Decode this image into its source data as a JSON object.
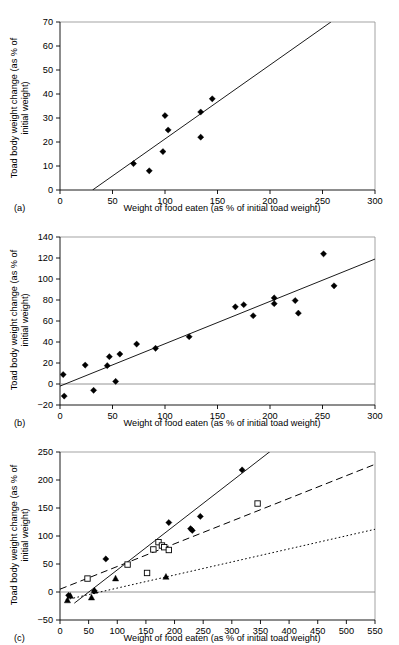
{
  "figure": {
    "axis_x_label": "Weight of food eaten (as % of initial toad weight)",
    "axis_y_label_line1": "Toad body weight change (as % of",
    "axis_y_label_line2": "initial weight)",
    "panel_labels": {
      "a": "(a)",
      "b": "(b)",
      "c": "(c)"
    }
  },
  "chart_data": [
    {
      "type": "scatter",
      "panel": "(a)",
      "title": "",
      "xlabel": "Weight of food eaten (as % of initial toad weight)",
      "ylabel": "Toad body weight change (as % of initial weight)",
      "xlim": [
        0,
        300
      ],
      "ylim": [
        0,
        70
      ],
      "xticks": [
        0,
        50,
        100,
        150,
        200,
        250,
        300
      ],
      "yticks": [
        0,
        10,
        20,
        30,
        40,
        50,
        60,
        70
      ],
      "grid": false,
      "legend": "none",
      "series": [
        {
          "name": "Toads",
          "marker": "filled-diamond",
          "points": [
            [
              70,
              11
            ],
            [
              85,
              8
            ],
            [
              98,
              16
            ],
            [
              100,
              31
            ],
            [
              103,
              25
            ],
            [
              134,
              22
            ],
            [
              134,
              32.5
            ],
            [
              145,
              38
            ]
          ]
        }
      ],
      "trendlines": [
        {
          "style": "solid",
          "x1": 31,
          "y1": 0,
          "x2": 258,
          "y2": 70
        }
      ]
    },
    {
      "type": "scatter",
      "panel": "(b)",
      "title": "",
      "xlabel": "Weight of food eaten (as % of initial toad weight)",
      "ylabel": "Toad body weight change (as % of initial weight)",
      "xlim": [
        0,
        300
      ],
      "ylim": [
        -20,
        140
      ],
      "xticks": [
        0,
        50,
        100,
        150,
        200,
        250,
        300
      ],
      "yticks": [
        -20,
        0,
        20,
        40,
        60,
        80,
        100,
        120,
        140
      ],
      "grid": false,
      "legend": "none",
      "zero_line": 0,
      "series": [
        {
          "name": "Toads",
          "marker": "filled-diamond",
          "points": [
            [
              3,
              9
            ],
            [
              4,
              -11.5
            ],
            [
              24,
              18
            ],
            [
              32,
              -6
            ],
            [
              45,
              17.5
            ],
            [
              47,
              26
            ],
            [
              53,
              2.5
            ],
            [
              57,
              28.5
            ],
            [
              73,
              38
            ],
            [
              91,
              34
            ],
            [
              123,
              45
            ],
            [
              167,
              73.5
            ],
            [
              175,
              75.5
            ],
            [
              184,
              65
            ],
            [
              204,
              82
            ],
            [
              204,
              76.5
            ],
            [
              224,
              79.5
            ],
            [
              227,
              67.5
            ],
            [
              251,
              124
            ],
            [
              261,
              93.5
            ]
          ]
        }
      ],
      "trendlines": [
        {
          "style": "solid",
          "x1": 0,
          "y1": -2,
          "x2": 300,
          "y2": 119
        }
      ]
    },
    {
      "type": "scatter",
      "panel": "(c)",
      "title": "",
      "xlabel": "Weight of food eaten (as % of initial toad weight)",
      "ylabel": "Toad body weight change (as % of initial weight)",
      "xlim": [
        0,
        550
      ],
      "ylim": [
        -50,
        250
      ],
      "xticks": [
        0,
        50,
        100,
        150,
        200,
        250,
        300,
        350,
        400,
        450,
        500,
        550
      ],
      "yticks": [
        -50,
        0,
        50,
        100,
        150,
        200,
        250
      ],
      "grid": false,
      "legend": "none",
      "zero_line": 0,
      "series": [
        {
          "name": "Filled diamonds",
          "marker": "filled-diamond",
          "line_style": "solid",
          "points": [
            [
              15,
              -6
            ],
            [
              60,
              2
            ],
            [
              80,
              59
            ],
            [
              190,
              124
            ],
            [
              228,
              113
            ],
            [
              231,
              110
            ],
            [
              245,
              135
            ],
            [
              318,
              218
            ]
          ]
        },
        {
          "name": "Open squares",
          "marker": "open-square",
          "line_style": "dashed",
          "points": [
            [
              48,
              24
            ],
            [
              118,
              49
            ],
            [
              152,
              34
            ],
            [
              163,
              76
            ],
            [
              172,
              89
            ],
            [
              178,
              83
            ],
            [
              182,
              80
            ],
            [
              190,
              75
            ],
            [
              345,
              158
            ]
          ]
        },
        {
          "name": "Filled triangles",
          "marker": "filled-triangle",
          "line_style": "dotted",
          "points": [
            [
              13,
              -15
            ],
            [
              18,
              -7
            ],
            [
              55,
              -10
            ],
            [
              60,
              2
            ],
            [
              97,
              24
            ],
            [
              185,
              27
            ]
          ]
        }
      ],
      "trendlines": [
        {
          "style": "solid",
          "x1": 25,
          "y1": -20,
          "x2": 372,
          "y2": 255
        },
        {
          "style": "dashed",
          "x1": 0,
          "y1": 5,
          "x2": 550,
          "y2": 228
        },
        {
          "style": "dotted",
          "x1": 10,
          "y1": -14,
          "x2": 550,
          "y2": 112
        }
      ]
    }
  ]
}
